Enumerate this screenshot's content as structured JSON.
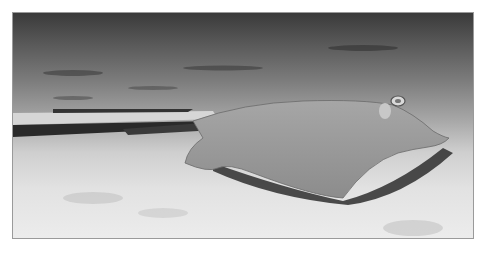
{
  "image": {
    "subject": "stingray resting on sandy seabed",
    "style": "grayscale photograph",
    "colors": {
      "border": "#9a9a9a",
      "background": "#ffffff",
      "seabed_dark": "#3a3a3a",
      "seabed_light": "#ececec",
      "ray_body": "#9a9a9a",
      "ray_shadow": "#2e2e2e"
    }
  }
}
